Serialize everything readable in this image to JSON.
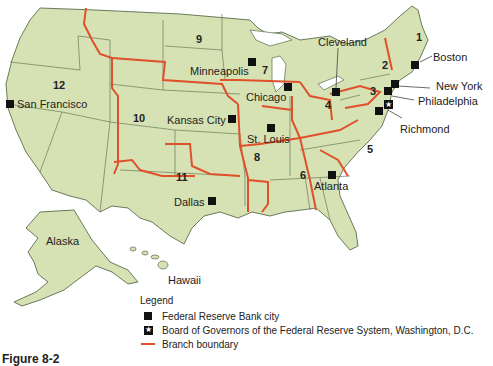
{
  "figure": {
    "caption": "Figure 8-2",
    "colors": {
      "land": "#d6e2b4",
      "state_border": "#6a7a5a",
      "district_boundary": "#e0502a",
      "marker": "#111111",
      "background": "#ffffff"
    }
  },
  "districts": [
    {
      "number": "1",
      "city": "Boston"
    },
    {
      "number": "2",
      "city": "New York"
    },
    {
      "number": "3",
      "city": "Philadelphia"
    },
    {
      "number": "4",
      "city": "Cleveland"
    },
    {
      "number": "5",
      "city": "Richmond"
    },
    {
      "number": "6",
      "city": "Atlanta"
    },
    {
      "number": "7",
      "city": "Chicago"
    },
    {
      "number": "8",
      "city": "St. Louis"
    },
    {
      "number": "9",
      "city": "Minneapolis"
    },
    {
      "number": "10",
      "city": "Kansas City"
    },
    {
      "number": "11",
      "city": "Dallas"
    },
    {
      "number": "12",
      "city": "San Francisco"
    }
  ],
  "regions": {
    "alaska": "Alaska",
    "hawaii": "Hawaii"
  },
  "legend": {
    "title": "Legend",
    "items": [
      {
        "symbol": "black-square",
        "label": "Federal Reserve Bank city"
      },
      {
        "symbol": "star-square",
        "label": "Board of Governors of the Federal Reserve System, Washington, D.C."
      },
      {
        "symbol": "red-line",
        "label": "Branch boundary"
      }
    ]
  }
}
